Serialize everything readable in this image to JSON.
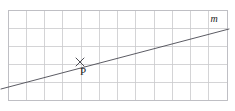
{
  "figure": {
    "kind": "coordinate-grid-with-line",
    "width": 235,
    "height": 111,
    "background_color": "#ffffff"
  },
  "grid": {
    "left": 8,
    "top": 10,
    "right": 227,
    "bottom": 100,
    "columns": 12,
    "rows": 5,
    "cell_width": 18.25,
    "cell_height": 18,
    "line_color": "#c9c9cc",
    "border_color": "#bdbdc2",
    "vertical_line_x": [
      8,
      26.25,
      44.5,
      62.75,
      81,
      99.25,
      117.5,
      135.75,
      154,
      172.25,
      190.5,
      208.75,
      227
    ],
    "horizontal_line_y": [
      10,
      28,
      46,
      64,
      82,
      100
    ]
  },
  "line": {
    "label": "m",
    "color": "#4a4a52",
    "start_x": 1,
    "start_y": 89,
    "end_x": 229,
    "end_y": 29,
    "slope_description": "rises to the right"
  },
  "label_m": {
    "text": "m",
    "x": 214,
    "y": 22,
    "font_size": 10,
    "color": "#1a1a1a"
  },
  "point": {
    "label": "P",
    "marker": "x-cross-marker",
    "x": 80,
    "y": 62,
    "marker_size": 4,
    "marker_color": "#3a3a42",
    "label_x": 83,
    "label_y": 75,
    "label_font_size": 11,
    "label_color": "#1a1a1a"
  }
}
